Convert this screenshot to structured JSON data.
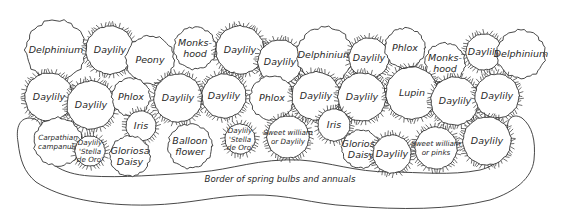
{
  "diagram": {
    "type": "garden-planting-plan",
    "border_label": "Border of spring bulbs and annuals",
    "colors": {
      "line": "#333333",
      "text": "#2a2a2a",
      "background": "#ffffff"
    },
    "plants": [
      {
        "id": "p1",
        "row": "back",
        "label": [
          "Delphinium"
        ],
        "x": 56,
        "y": 50,
        "r": 30,
        "style": "wavy"
      },
      {
        "id": "p2",
        "row": "back",
        "label": [
          "Daylily"
        ],
        "x": 110,
        "y": 50,
        "r": 24,
        "style": "spiky"
      },
      {
        "id": "p3",
        "row": "back",
        "label": [
          "Peony"
        ],
        "x": 150,
        "y": 60,
        "r": 24,
        "style": "wavy"
      },
      {
        "id": "p4",
        "row": "back",
        "label": [
          "Monks-",
          "hood"
        ],
        "x": 195,
        "y": 48,
        "r": 21,
        "style": "wavy"
      },
      {
        "id": "p5",
        "row": "back",
        "label": [
          "Daylily"
        ],
        "x": 240,
        "y": 50,
        "r": 24,
        "style": "spiky"
      },
      {
        "id": "p6",
        "row": "back",
        "label": [
          "Daylily"
        ],
        "x": 280,
        "y": 62,
        "r": 22,
        "style": "spiky"
      },
      {
        "id": "p7",
        "row": "back",
        "label": [
          "Delphinium"
        ],
        "x": 325,
        "y": 55,
        "r": 28,
        "style": "wavy"
      },
      {
        "id": "p8",
        "row": "back",
        "label": [
          "Daylily"
        ],
        "x": 369,
        "y": 58,
        "r": 20,
        "style": "spiky"
      },
      {
        "id": "p9",
        "row": "back",
        "label": [
          "Phlox"
        ],
        "x": 405,
        "y": 48,
        "r": 20,
        "style": "wavy"
      },
      {
        "id": "p10",
        "row": "back",
        "label": [
          "Monks-",
          "hood"
        ],
        "x": 445,
        "y": 63,
        "r": 20,
        "style": "wavy"
      },
      {
        "id": "p11",
        "row": "back",
        "label": [
          "Daylily"
        ],
        "x": 484,
        "y": 52,
        "r": 18,
        "style": "spiky"
      },
      {
        "id": "p12",
        "row": "back",
        "label": [
          "Delphinium"
        ],
        "x": 521,
        "y": 54,
        "r": 24,
        "style": "wavy"
      },
      {
        "id": "p13",
        "row": "middle",
        "label": [
          "Daylily"
        ],
        "x": 49,
        "y": 97,
        "r": 24,
        "style": "spiky"
      },
      {
        "id": "p14",
        "row": "middle",
        "label": [
          "Daylily"
        ],
        "x": 91,
        "y": 105,
        "r": 24,
        "style": "spiky"
      },
      {
        "id": "p15",
        "row": "middle",
        "label": [
          "Phlox"
        ],
        "x": 131,
        "y": 97,
        "r": 19,
        "style": "wavy"
      },
      {
        "id": "p16",
        "row": "middle",
        "label": [
          "Daylily"
        ],
        "x": 178,
        "y": 98,
        "r": 24,
        "style": "spiky"
      },
      {
        "id": "p17",
        "row": "middle",
        "label": [
          "Daylily"
        ],
        "x": 224,
        "y": 96,
        "r": 22,
        "style": "spiky"
      },
      {
        "id": "p18",
        "row": "middle",
        "label": [
          "Phlox"
        ],
        "x": 272,
        "y": 98,
        "r": 22,
        "style": "wavy"
      },
      {
        "id": "p19",
        "row": "middle",
        "label": [
          "Daylily"
        ],
        "x": 316,
        "y": 96,
        "r": 24,
        "style": "spiky"
      },
      {
        "id": "p20",
        "row": "middle",
        "label": [
          "Daylily"
        ],
        "x": 362,
        "y": 97,
        "r": 24,
        "style": "spiky"
      },
      {
        "id": "p21",
        "row": "middle",
        "label": [
          "Lupin"
        ],
        "x": 412,
        "y": 93,
        "r": 26,
        "style": "spiky"
      },
      {
        "id": "p22",
        "row": "middle",
        "label": [
          "Daylily"
        ],
        "x": 455,
        "y": 101,
        "r": 24,
        "style": "spiky"
      },
      {
        "id": "p23",
        "row": "middle",
        "label": [
          "Daylily"
        ],
        "x": 497,
        "y": 96,
        "r": 22,
        "style": "spiky"
      },
      {
        "id": "p24",
        "row": "front",
        "label": [
          "Carpathian",
          "campanula"
        ],
        "x": 58,
        "y": 142,
        "r": 24,
        "style": "wavy",
        "small": true
      },
      {
        "id": "p25",
        "row": "front",
        "label": [
          "Daylily",
          "'Stella",
          "de Oro'"
        ],
        "x": 90,
        "y": 151,
        "r": 15,
        "style": "spiky",
        "small": true
      },
      {
        "id": "p26",
        "row": "front",
        "label": [
          "Iris"
        ],
        "x": 141,
        "y": 126,
        "r": 15,
        "style": "spiky"
      },
      {
        "id": "p27",
        "row": "front",
        "label": [
          "Gloriosa",
          "Daisy"
        ],
        "x": 130,
        "y": 156,
        "r": 20,
        "style": "wavy"
      },
      {
        "id": "p28",
        "row": "front",
        "label": [
          "Balloon",
          "flower"
        ],
        "x": 190,
        "y": 146,
        "r": 22,
        "style": "wavy"
      },
      {
        "id": "p29",
        "row": "front",
        "label": [
          "Daylily",
          "'Stella",
          "de Oro'"
        ],
        "x": 240,
        "y": 139,
        "r": 15,
        "style": "spiky",
        "small": true
      },
      {
        "id": "p30",
        "row": "front",
        "label": [
          "Sweet william",
          "or Daylily"
        ],
        "x": 288,
        "y": 137,
        "r": 21,
        "style": "spiky",
        "small": true
      },
      {
        "id": "p31",
        "row": "front",
        "label": [
          "Iris"
        ],
        "x": 334,
        "y": 125,
        "r": 16,
        "style": "spiky"
      },
      {
        "id": "p32",
        "row": "front",
        "label": [
          "Gloriosa",
          "Daisy"
        ],
        "x": 361,
        "y": 149,
        "r": 19,
        "style": "wavy"
      },
      {
        "id": "p33",
        "row": "front",
        "label": [
          "Daylily"
        ],
        "x": 392,
        "y": 154,
        "r": 19,
        "style": "spiky"
      },
      {
        "id": "p34",
        "row": "front",
        "label": [
          "Sweet william",
          "or pinks"
        ],
        "x": 436,
        "y": 148,
        "r": 21,
        "style": "spiky",
        "small": true
      },
      {
        "id": "p35",
        "row": "front",
        "label": [
          "Daylily"
        ],
        "x": 487,
        "y": 141,
        "r": 24,
        "style": "spiky"
      }
    ]
  }
}
